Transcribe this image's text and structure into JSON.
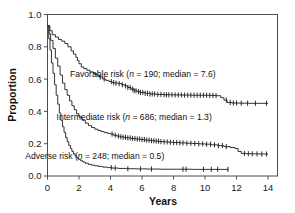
{
  "chart_data": {
    "type": "line",
    "title": "",
    "subtitle": "",
    "xlabel": "Years",
    "ylabel": "Proportion",
    "xlim": [
      0,
      14.6
    ],
    "ylim": [
      0.0,
      1.0
    ],
    "xticks": [
      0,
      2,
      4,
      6,
      8,
      10,
      12,
      14
    ],
    "xtick_labels": [
      "0",
      "2",
      "4",
      "6",
      "8",
      "10",
      "12",
      "14"
    ],
    "yticks": [
      0.0,
      0.2,
      0.4,
      0.6,
      0.8,
      1.0
    ],
    "ytick_labels": [
      "0.0",
      "0.2",
      "0.4",
      "0.6",
      "0.8",
      "1.0"
    ],
    "grid": false,
    "legend_position": "inline-annotation",
    "plot_style": "kaplan-meier-step-with-censor-ticks",
    "series": [
      {
        "name": "Favorable risk",
        "n": 190,
        "median": 7.6,
        "label": "Favorable risk (n = 190; median = 7.6)",
        "label_x": 6.05,
        "label_y": 0.615,
        "color": "#1c1c1c",
        "points": [
          [
            0.0,
            0.93
          ],
          [
            0.15,
            0.9
          ],
          [
            0.3,
            0.875
          ],
          [
            0.5,
            0.86
          ],
          [
            0.7,
            0.845
          ],
          [
            0.9,
            0.835
          ],
          [
            1.1,
            0.82
          ],
          [
            1.3,
            0.8
          ],
          [
            1.5,
            0.775
          ],
          [
            1.65,
            0.755
          ],
          [
            1.8,
            0.735
          ],
          [
            1.9,
            0.715
          ],
          [
            2.0,
            0.695
          ],
          [
            2.15,
            0.675
          ],
          [
            2.3,
            0.665
          ],
          [
            2.5,
            0.655
          ],
          [
            2.7,
            0.645
          ],
          [
            2.9,
            0.635
          ],
          [
            3.1,
            0.625
          ],
          [
            3.3,
            0.612
          ],
          [
            3.5,
            0.6
          ],
          [
            3.7,
            0.592
          ],
          [
            3.9,
            0.585
          ],
          [
            4.1,
            0.578
          ],
          [
            4.3,
            0.575
          ],
          [
            4.5,
            0.572
          ],
          [
            4.7,
            0.565
          ],
          [
            4.9,
            0.558
          ],
          [
            5.1,
            0.548
          ],
          [
            5.3,
            0.538
          ],
          [
            5.5,
            0.528
          ],
          [
            5.7,
            0.522
          ],
          [
            5.9,
            0.517
          ],
          [
            6.2,
            0.512
          ],
          [
            6.5,
            0.508
          ],
          [
            6.9,
            0.505
          ],
          [
            7.4,
            0.503
          ],
          [
            8.0,
            0.502
          ],
          [
            8.6,
            0.501
          ],
          [
            9.2,
            0.5
          ],
          [
            9.8,
            0.5
          ],
          [
            10.3,
            0.499
          ],
          [
            10.7,
            0.497
          ],
          [
            11.0,
            0.485
          ],
          [
            11.2,
            0.47
          ],
          [
            11.4,
            0.455
          ],
          [
            11.7,
            0.452
          ],
          [
            12.2,
            0.451
          ],
          [
            12.8,
            0.45
          ],
          [
            13.4,
            0.45
          ],
          [
            14.0,
            0.45
          ]
        ],
        "censor_x": [
          3.35,
          3.6,
          4.05,
          4.2,
          4.35,
          4.55,
          4.75,
          4.95,
          5.1,
          5.25,
          5.4,
          5.5,
          5.62,
          5.78,
          5.9,
          6.05,
          6.2,
          6.35,
          6.5,
          6.65,
          6.8,
          7.0,
          7.2,
          7.4,
          7.55,
          7.7,
          7.9,
          8.1,
          8.3,
          8.5,
          8.7,
          8.9,
          9.1,
          9.3,
          9.5,
          9.7,
          9.9,
          10.1,
          10.3,
          10.5,
          10.7,
          11.35,
          11.6,
          11.8,
          12.0,
          12.3,
          12.7,
          13.2,
          13.9
        ]
      },
      {
        "name": "Intermediate risk",
        "n": 686,
        "median": 1.3,
        "label": "Intermediate risk (n = 686; median = 1.3)",
        "label_x": 5.5,
        "label_y": 0.345,
        "color": "#1c1c1c",
        "points": [
          [
            0.0,
            0.93
          ],
          [
            0.1,
            0.88
          ],
          [
            0.2,
            0.84
          ],
          [
            0.35,
            0.79
          ],
          [
            0.5,
            0.73
          ],
          [
            0.65,
            0.68
          ],
          [
            0.8,
            0.625
          ],
          [
            0.95,
            0.575
          ],
          [
            1.1,
            0.535
          ],
          [
            1.25,
            0.5
          ],
          [
            1.4,
            0.465
          ],
          [
            1.55,
            0.435
          ],
          [
            1.7,
            0.41
          ],
          [
            1.85,
            0.385
          ],
          [
            2.0,
            0.365
          ],
          [
            2.2,
            0.345
          ],
          [
            2.4,
            0.327
          ],
          [
            2.6,
            0.312
          ],
          [
            2.8,
            0.3
          ],
          [
            3.0,
            0.29
          ],
          [
            3.2,
            0.282
          ],
          [
            3.4,
            0.275
          ],
          [
            3.6,
            0.269
          ],
          [
            3.8,
            0.264
          ],
          [
            4.0,
            0.26
          ],
          [
            4.2,
            0.252
          ],
          [
            4.4,
            0.247
          ],
          [
            4.6,
            0.243
          ],
          [
            4.8,
            0.24
          ],
          [
            5.0,
            0.236
          ],
          [
            5.3,
            0.232
          ],
          [
            5.6,
            0.229
          ],
          [
            5.9,
            0.226
          ],
          [
            6.2,
            0.222
          ],
          [
            6.5,
            0.219
          ],
          [
            6.8,
            0.216
          ],
          [
            7.1,
            0.213
          ],
          [
            7.4,
            0.211
          ],
          [
            7.7,
            0.209
          ],
          [
            8.0,
            0.207
          ],
          [
            8.4,
            0.205
          ],
          [
            8.8,
            0.203
          ],
          [
            9.2,
            0.201
          ],
          [
            9.6,
            0.199
          ],
          [
            10.0,
            0.197
          ],
          [
            10.4,
            0.193
          ],
          [
            10.8,
            0.188
          ],
          [
            11.2,
            0.182
          ],
          [
            11.6,
            0.176
          ],
          [
            11.9,
            0.17
          ],
          [
            12.1,
            0.152
          ],
          [
            12.3,
            0.14
          ],
          [
            12.6,
            0.138
          ],
          [
            13.0,
            0.137
          ],
          [
            13.5,
            0.136
          ],
          [
            14.0,
            0.136
          ]
        ],
        "censor_x": [
          4.1,
          4.3,
          4.5,
          4.65,
          4.8,
          4.95,
          5.1,
          5.25,
          5.4,
          5.55,
          5.7,
          5.85,
          6.0,
          6.15,
          6.3,
          6.45,
          6.6,
          6.75,
          6.9,
          7.05,
          7.2,
          7.4,
          7.6,
          7.8,
          8.0,
          8.2,
          8.4,
          8.6,
          8.85,
          9.1,
          9.35,
          9.6,
          9.85,
          10.1,
          10.35,
          10.6,
          10.85,
          11.1,
          11.35,
          12.5,
          12.75,
          13.0,
          13.3,
          13.6,
          13.9
        ]
      },
      {
        "name": "Adverse risk",
        "n": 248,
        "median": 0.5,
        "label": "Adverse risk (n = 248; median = 0.5)",
        "label_x": 3.0,
        "label_y": 0.105,
        "color": "#1c1c1c",
        "points": [
          [
            0.0,
            0.93
          ],
          [
            0.08,
            0.85
          ],
          [
            0.16,
            0.78
          ],
          [
            0.25,
            0.7
          ],
          [
            0.35,
            0.635
          ],
          [
            0.45,
            0.565
          ],
          [
            0.55,
            0.5
          ],
          [
            0.65,
            0.445
          ],
          [
            0.75,
            0.39
          ],
          [
            0.85,
            0.345
          ],
          [
            0.95,
            0.305
          ],
          [
            1.05,
            0.27
          ],
          [
            1.15,
            0.238
          ],
          [
            1.25,
            0.212
          ],
          [
            1.35,
            0.19
          ],
          [
            1.45,
            0.17
          ],
          [
            1.55,
            0.152
          ],
          [
            1.65,
            0.138
          ],
          [
            1.75,
            0.125
          ],
          [
            1.85,
            0.113
          ],
          [
            1.95,
            0.103
          ],
          [
            2.1,
            0.094
          ],
          [
            2.25,
            0.086
          ],
          [
            2.4,
            0.079
          ],
          [
            2.6,
            0.072
          ],
          [
            2.8,
            0.067
          ],
          [
            3.0,
            0.063
          ],
          [
            3.25,
            0.059
          ],
          [
            3.5,
            0.055
          ],
          [
            3.8,
            0.052
          ],
          [
            4.1,
            0.049
          ],
          [
            4.5,
            0.047
          ],
          [
            5.0,
            0.045
          ],
          [
            5.6,
            0.044
          ],
          [
            6.3,
            0.043
          ],
          [
            7.2,
            0.042
          ],
          [
            8.2,
            0.042
          ],
          [
            9.2,
            0.041
          ],
          [
            10.2,
            0.041
          ],
          [
            11.5,
            0.041
          ]
        ],
        "censor_x": [
          4.05,
          4.3,
          5.1,
          5.9,
          6.6,
          8.6,
          8.8,
          9.9,
          10.4,
          10.8,
          11.45
        ]
      }
    ]
  },
  "figure": {
    "background_color": "#ffffff",
    "axis_color": "#4d4d4d",
    "curve_color": "#1c1c1c"
  }
}
